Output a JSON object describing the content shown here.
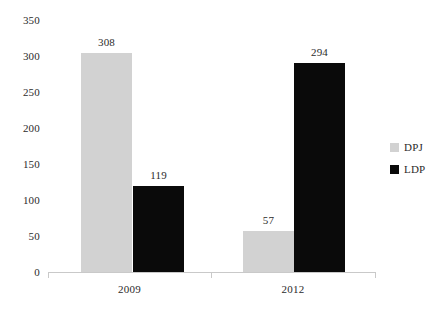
{
  "chart_data": {
    "type": "bar",
    "title": "",
    "subtitle": "",
    "xlabel": "",
    "ylabel": "",
    "categories": [
      "2009",
      "2012"
    ],
    "series": [
      {
        "name": "DPJ",
        "color": "#d2d2d2",
        "values": [
          308,
          57
        ]
      },
      {
        "name": "LDP",
        "color": "#0a0a0a",
        "values": [
          119,
          294
        ]
      }
    ],
    "ylim": [
      0,
      350
    ],
    "y_ticks": [
      0,
      50,
      100,
      150,
      200,
      250,
      300,
      350
    ],
    "y_tick_labels": [
      "0",
      "50",
      "100",
      "150",
      "200",
      "250",
      "300",
      "350"
    ],
    "data_labels": [
      "308",
      "119",
      "57",
      "294"
    ],
    "grid": false,
    "legend_position": "right",
    "legend": [
      {
        "label": "DPJ",
        "color": "#d2d2d2"
      },
      {
        "label": "LDP",
        "color": "#0a0a0a"
      }
    ]
  },
  "axis": {
    "y": {
      "ticks": [
        {
          "label": "350",
          "top": 15
        },
        {
          "label": "300",
          "top": 51
        },
        {
          "label": "250",
          "top": 87
        },
        {
          "label": "200",
          "top": 123
        },
        {
          "label": "150",
          "top": 159
        },
        {
          "label": "100",
          "top": 195
        },
        {
          "label": "50",
          "top": 231
        },
        {
          "label": "0",
          "top": 267
        }
      ]
    },
    "x": {
      "categories": [
        {
          "label": "2009",
          "left": 48,
          "width": 163
        },
        {
          "label": "2012",
          "left": 211,
          "width": 164
        }
      ]
    }
  },
  "bars": [
    {
      "name": "bar-2009-dpj",
      "label": "308",
      "left": 81,
      "width": 51,
      "height": 219,
      "color": "#d2d2d2",
      "label_left": 81,
      "label_top": 37
    },
    {
      "name": "bar-2009-ldp",
      "label": "119",
      "left": 133,
      "width": 51,
      "height": 86,
      "color": "#0a0a0a",
      "label_left": 133,
      "label_top": 170
    },
    {
      "name": "bar-2012-dpj",
      "label": "57",
      "left": 243,
      "width": 51,
      "height": 41,
      "color": "#d2d2d2",
      "label_left": 243,
      "label_top": 215
    },
    {
      "name": "bar-2012-ldp",
      "label": "294",
      "left": 294,
      "width": 51,
      "height": 209,
      "color": "#0a0a0a",
      "label_left": 294,
      "label_top": 47
    }
  ]
}
